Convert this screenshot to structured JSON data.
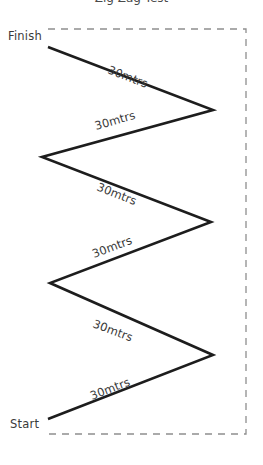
{
  "diagram": {
    "type": "zigzag-course",
    "canvas": {
      "width": 263,
      "height": 465
    },
    "background_color": "#ffffff",
    "line_color": "#1d1d1d",
    "boundary_color": "#8e8e8e",
    "text_color": "#3a3a3a",
    "cropped_title": "Zig Zag Test",
    "boundary": {
      "name": "dashed-boundary",
      "points": "48,29 246,29 246,434 48,434",
      "dash_pattern": "7 6"
    },
    "path": {
      "name": "zigzag-route",
      "points": "48,419 213,355 50,283 211,222 42,157 213,110 48,47"
    },
    "endpoints": [
      {
        "id": "finish",
        "label": "Finish",
        "x": 8,
        "y": 40
      },
      {
        "id": "start",
        "label": "Start",
        "x": 10,
        "y": 428
      }
    ],
    "segments": [
      {
        "id": "seg-1",
        "label": "30mtrs",
        "x": 92,
        "y": 400,
        "rotate": -21.2
      },
      {
        "id": "seg-2",
        "label": "30mtrs",
        "x": 92,
        "y": 327,
        "rotate": 20.5
      },
      {
        "id": "seg-3",
        "label": "30mtrs",
        "x": 94,
        "y": 258,
        "rotate": -20.6
      },
      {
        "id": "seg-4",
        "label": "30mtrs",
        "x": 96,
        "y": 190,
        "rotate": 21.6
      },
      {
        "id": "seg-5",
        "label": "30mtrs",
        "x": 96,
        "y": 130,
        "rotate": -16.1
      },
      {
        "id": "seg-6",
        "label": "30mtrs",
        "x": 107,
        "y": 73,
        "rotate": 21.1
      }
    ]
  }
}
